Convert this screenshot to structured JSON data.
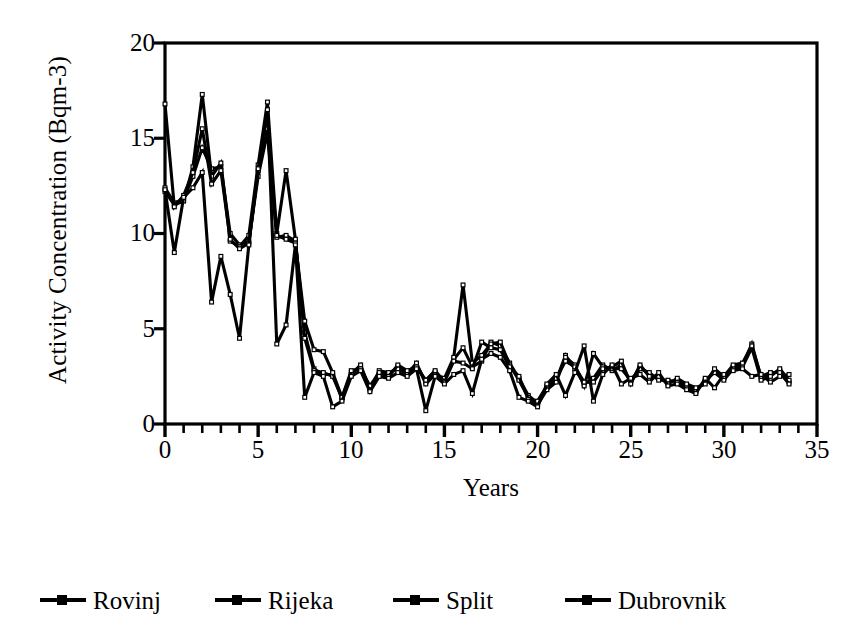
{
  "chart_data": {
    "type": "line",
    "title": "",
    "subtitle": "",
    "xlabel": "Years",
    "ylabel": "Activity Concentration (Bqm-3)",
    "xlim": [
      0,
      35
    ],
    "ylim": [
      0,
      20
    ],
    "xticks": [
      0,
      5,
      10,
      15,
      20,
      25,
      30,
      35
    ],
    "xtick_labels": [
      "0",
      "5",
      "10",
      "15",
      "20",
      "25",
      "30",
      "35"
    ],
    "x_minor_tick_step": 1,
    "yticks": [
      0,
      5,
      10,
      15,
      20
    ],
    "ytick_labels": [
      "0",
      "5",
      "10",
      "15",
      "20"
    ],
    "grid": false,
    "legend_position": "below",
    "marker": "square",
    "line_color": "#000000",
    "x": [
      0,
      0.5,
      1,
      1.5,
      2,
      2.5,
      3,
      3.5,
      4,
      4.5,
      5,
      5.5,
      6,
      6.5,
      7,
      7.5,
      8,
      8.5,
      9,
      9.5,
      10,
      10.5,
      11,
      11.5,
      12,
      12.5,
      13,
      13.5,
      14,
      14.5,
      15,
      15.5,
      16,
      16.5,
      17,
      17.5,
      18,
      18.5,
      19,
      19.5,
      20,
      20.5,
      21,
      21.5,
      22,
      22.5,
      23,
      23.5,
      24,
      24.5,
      25,
      25.5,
      26,
      26.5,
      27,
      27.5,
      28,
      28.5,
      29,
      29.5,
      30,
      30.5,
      31,
      31.5,
      32,
      32.5,
      33,
      33.5
    ],
    "series": [
      {
        "name": "Rovinj",
        "color": "#000000",
        "values": [
          12.4,
          11.6,
          11.8,
          13.0,
          14.5,
          13.4,
          13.5,
          10.0,
          9.4,
          9.6,
          13.0,
          15.3,
          9.8,
          9.9,
          9.6,
          4.8,
          2.9,
          2.6,
          2.6,
          1.3,
          2.7,
          3.0,
          1.9,
          2.6,
          2.6,
          3.0,
          2.7,
          3.1,
          2.2,
          2.7,
          2.3,
          3.4,
          4.0,
          3.0,
          3.3,
          4.3,
          4.1,
          3.2,
          2.4,
          1.5,
          1.1,
          1.9,
          2.3,
          3.6,
          2.9,
          2.1,
          2.4,
          3.1,
          2.8,
          3.1,
          2.2,
          3.0,
          2.6,
          2.4,
          2.2,
          2.3,
          2.0,
          1.8,
          2.2,
          2.8,
          2.4,
          3.0,
          3.1,
          4.2,
          2.4,
          2.6,
          2.8,
          2.2
        ]
      },
      {
        "name": "Rijeka",
        "color": "#000000",
        "values": [
          12.2,
          11.5,
          11.7,
          13.5,
          17.3,
          13.0,
          13.7,
          9.6,
          9.3,
          9.9,
          13.6,
          16.9,
          10.0,
          13.3,
          9.7,
          4.5,
          2.8,
          2.7,
          2.5,
          1.4,
          2.6,
          3.1,
          1.8,
          2.8,
          2.7,
          2.9,
          2.6,
          3.2,
          2.1,
          2.6,
          2.4,
          3.5,
          7.3,
          3.2,
          3.6,
          4.2,
          4.3,
          3.1,
          2.3,
          1.4,
          1.0,
          1.8,
          2.2,
          3.5,
          3.1,
          2.0,
          3.7,
          3.0,
          2.9,
          2.9,
          2.3,
          2.9,
          2.7,
          2.3,
          2.3,
          2.2,
          1.9,
          1.7,
          2.3,
          2.7,
          2.3,
          2.9,
          3.0,
          4.0,
          2.3,
          2.5,
          2.9,
          2.3
        ]
      },
      {
        "name": "Split",
        "color": "#000000",
        "values": [
          16.8,
          11.4,
          12.0,
          13.2,
          15.5,
          12.6,
          13.3,
          9.7,
          9.2,
          9.5,
          13.3,
          15.5,
          9.9,
          9.7,
          9.5,
          5.4,
          3.9,
          3.8,
          2.7,
          1.4,
          2.8,
          2.9,
          2.0,
          2.7,
          2.5,
          3.1,
          2.8,
          3.0,
          2.3,
          2.8,
          2.2,
          3.3,
          3.2,
          2.9,
          4.3,
          4.0,
          3.9,
          3.0,
          2.5,
          1.3,
          1.2,
          2.0,
          2.4,
          3.3,
          3.0,
          2.2,
          2.2,
          2.9,
          3.0,
          3.3,
          2.1,
          3.1,
          2.5,
          2.5,
          2.1,
          2.4,
          2.1,
          1.9,
          2.1,
          2.9,
          2.5,
          3.1,
          3.2,
          4.1,
          2.5,
          2.7,
          2.7,
          2.1
        ]
      },
      {
        "name": "Dubrovnik",
        "color": "#000000",
        "values": [
          12.3,
          9.0,
          11.9,
          12.4,
          13.2,
          6.4,
          8.8,
          6.8,
          4.5,
          9.4,
          13.4,
          16.5,
          4.2,
          5.2,
          9.4,
          1.4,
          2.7,
          2.5,
          0.9,
          1.2,
          2.5,
          2.8,
          1.7,
          2.5,
          2.4,
          2.7,
          2.5,
          2.9,
          0.7,
          2.5,
          2.1,
          2.6,
          2.8,
          1.6,
          3.4,
          3.7,
          3.5,
          2.8,
          1.4,
          1.2,
          0.9,
          2.1,
          2.6,
          1.5,
          2.7,
          4.1,
          1.2,
          2.6,
          3.1,
          2.1,
          2.4,
          2.6,
          2.2,
          2.7,
          2.0,
          2.1,
          1.8,
          1.6,
          2.4,
          1.9,
          2.6,
          2.8,
          2.9,
          2.5,
          2.6,
          2.2,
          2.5,
          2.6
        ]
      }
    ]
  },
  "axis": {
    "ylabel": "Activity Concentration (Bqm-3)",
    "xlabel": "Years",
    "ytick_labels": [
      "0",
      "5",
      "10",
      "15",
      "20"
    ],
    "xtick_labels": [
      "0",
      "5",
      "10",
      "15",
      "20",
      "25",
      "30",
      "35"
    ]
  },
  "legend": {
    "entries": [
      {
        "label": "Rovinj"
      },
      {
        "label": "Rijeka"
      },
      {
        "label": "Split"
      },
      {
        "label": "Dubrovnik"
      }
    ]
  }
}
